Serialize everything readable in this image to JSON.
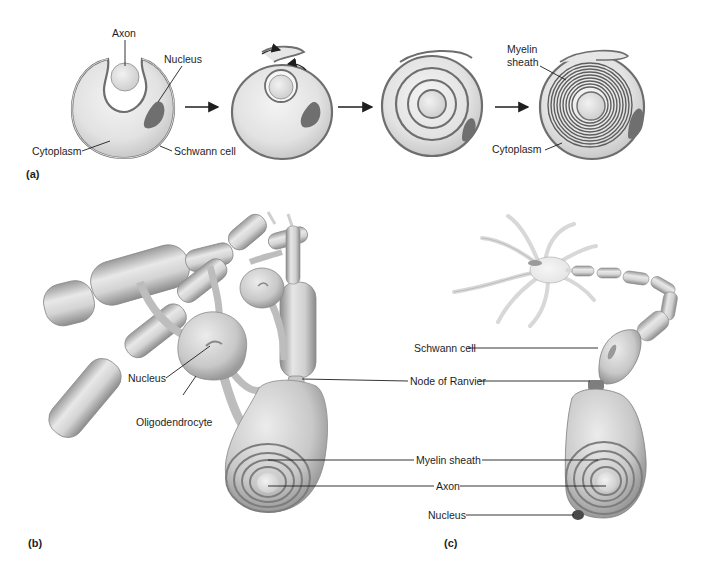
{
  "figure": {
    "panels": [
      {
        "id": "a",
        "label": "(a)"
      },
      {
        "id": "b",
        "label": "(b)"
      },
      {
        "id": "c",
        "label": "(c)"
      }
    ]
  },
  "panel_a": {
    "stages": 4,
    "labels": {
      "axon": "Axon",
      "nucleus": "Nucleus",
      "cytoplasm_left": "Cytoplasm",
      "schwann_cell": "Schwann cell",
      "myelin_sheath_line1": "Myelin",
      "myelin_sheath_line2": "sheath",
      "cytoplasm_right": "Cytoplasm"
    }
  },
  "panel_b": {
    "labels": {
      "nucleus": "Nucleus",
      "oligodendrocyte": "Oligodendrocyte"
    }
  },
  "shared_labels": {
    "node_of_ranvier": "Node of Ranvier",
    "myelin_sheath": "Myelin sheath",
    "axon": "Axon"
  },
  "panel_c": {
    "labels": {
      "schwann_cell": "Schwann cell",
      "nucleus": "Nucleus"
    }
  },
  "colors": {
    "background": "#ffffff",
    "cell_fill": "#e6e6e6",
    "cell_shadow": "#bdbdbd",
    "membrane": "#6e6e6e",
    "nucleus": "#7a7a7a",
    "line": "#1e1e1e"
  }
}
